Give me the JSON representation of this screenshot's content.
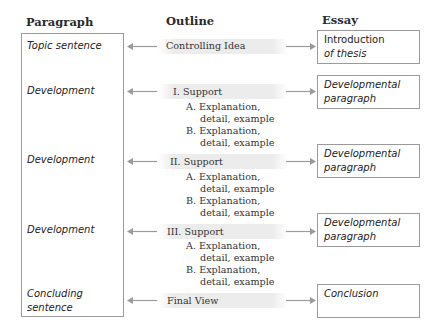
{
  "headers": {
    "paragraph": "Paragraph",
    "outline": "Outline",
    "essay": "Essay"
  },
  "paragraph_items": [
    {
      "label": "Topic sentence"
    },
    {
      "label": "Development"
    },
    {
      "label": "Development"
    },
    {
      "label": "Development"
    },
    {
      "label": "Concluding sentence"
    }
  ],
  "outline_items": [
    {
      "label": "Controlling Idea"
    },
    {
      "label": "I. Support",
      "subs": [
        "A. Explanation,",
        "detail, example",
        "B. Explanation,",
        "detail, example"
      ]
    },
    {
      "label": "II. Support",
      "subs": [
        "A. Explanation,",
        "detail, example",
        "B. Explanation,",
        "detail, example"
      ]
    },
    {
      "label": "III. Support",
      "subs": [
        "A. Explanation,",
        "detail, example",
        "B. Explanation,",
        "detail, example"
      ]
    },
    {
      "label": "Final View"
    }
  ],
  "essay_items": [
    {
      "line1": "Introduction",
      "line2": "of thesis"
    },
    {
      "line1": "Developmental",
      "line2": "paragraph"
    },
    {
      "line1": "Developmental",
      "line2": "paragraph"
    },
    {
      "line1": "Developmental",
      "line2": "paragraph"
    },
    {
      "line1": "Conclusion",
      "line2": ""
    }
  ],
  "colors": {
    "arrow": "#9a9a9a",
    "border": "#9a9a9a",
    "band": "#ececec"
  }
}
